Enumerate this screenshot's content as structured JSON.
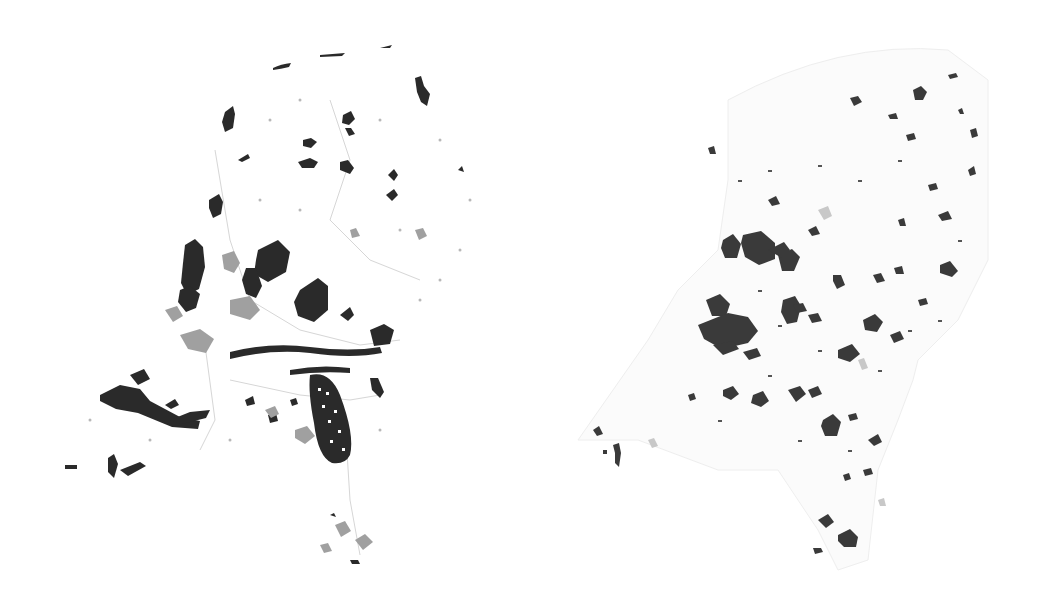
{
  "maps": [
    {
      "id": "left",
      "subject": "Netherlands land-use map (grayscale)",
      "colors": {
        "dark": "#2a2a2a",
        "mid": "#9a9a9a",
        "light": "#d8d8d8",
        "background": "#ffffff"
      }
    },
    {
      "id": "right",
      "subject": "Netherlands urban areas map (grayscale)",
      "colors": {
        "dark": "#3a3a3a",
        "mid": "#8c8c8c",
        "light": "#e6e6e6",
        "background": "#ffffff"
      }
    }
  ]
}
